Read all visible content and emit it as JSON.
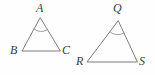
{
  "figure": {
    "type": "geometry-diagram",
    "background_color": "#fefefe",
    "stroke_color": "#6e6e6e",
    "label_color": "#3b3b3b",
    "stroke_width": 0.9,
    "shapes": [
      {
        "name": "triangle-abc",
        "vertices": [
          {
            "label": "A",
            "x": 40,
            "y": 18,
            "label_x": 36,
            "label_y": 2
          },
          {
            "label": "B",
            "x": 22,
            "y": 51,
            "label_x": 10,
            "label_y": 44
          },
          {
            "label": "C",
            "x": 60,
            "y": 51,
            "label_x": 62,
            "label_y": 44
          }
        ],
        "angle_arc": {
          "at": "A",
          "start_x": 34,
          "start_y": 29,
          "end_x": 47,
          "end_y": 30,
          "radius": 11
        }
      },
      {
        "name": "triangle-qrs",
        "vertices": [
          {
            "label": "Q",
            "x": 118,
            "y": 21,
            "label_x": 113,
            "label_y": 2
          },
          {
            "label": "R",
            "x": 87,
            "y": 62,
            "label_x": 76,
            "label_y": 55
          },
          {
            "label": "S",
            "x": 137,
            "y": 62,
            "label_x": 139,
            "label_y": 55
          }
        ],
        "angle_arc": {
          "at": "Q",
          "start_x": 110,
          "start_y": 32,
          "end_x": 124,
          "end_y": 33,
          "radius": 12
        }
      }
    ]
  }
}
